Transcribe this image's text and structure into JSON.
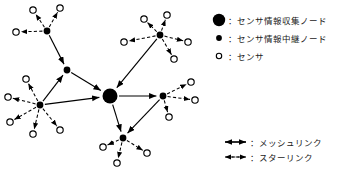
{
  "figure": {
    "title": "",
    "description_type": "wireless-sensor-network-topology"
  },
  "legend_nodes": {
    "items": [
      {
        "marker": "large-filled-circle",
        "separator": "：",
        "label": "センサ情報収集ノード"
      },
      {
        "marker": "small-filled-circle",
        "separator": "：",
        "label": "センサ情報中継ノード"
      },
      {
        "marker": "small-open-circle",
        "separator": "：",
        "label": "センサ"
      }
    ]
  },
  "legend_links": {
    "items": [
      {
        "marker": "solid-double-arrow",
        "separator": "：",
        "label": "メッシュリンク"
      },
      {
        "marker": "dashed-double-arrow",
        "separator": "：",
        "label": "スターリンク"
      }
    ]
  },
  "colors": {
    "ink": "#000000",
    "background": "#ffffff",
    "text": "#1a1a1a"
  },
  "chart_data": {
    "type": "diagram",
    "graph": {
      "collection_nodes": [
        {
          "id": "C1",
          "x": 110,
          "y": 96,
          "r": 7.5
        }
      ],
      "relay_nodes": [
        {
          "id": "R1",
          "x": 47,
          "y": 31,
          "r": 3.4
        },
        {
          "id": "R2",
          "x": 160,
          "y": 35,
          "r": 3.4
        },
        {
          "id": "R3",
          "x": 67,
          "y": 70,
          "r": 3.4
        },
        {
          "id": "R4",
          "x": 40,
          "y": 105,
          "r": 3.4
        },
        {
          "id": "R5",
          "x": 163,
          "y": 96,
          "r": 3.4
        },
        {
          "id": "R6",
          "x": 123,
          "y": 138,
          "r": 3.4
        }
      ],
      "sensors": [
        {
          "id": "S1",
          "x": 33,
          "y": 10,
          "parent": "R1"
        },
        {
          "id": "S2",
          "x": 60,
          "y": 8,
          "parent": "R1"
        },
        {
          "id": "S3",
          "x": 16,
          "y": 32,
          "parent": "R1"
        },
        {
          "id": "S4",
          "x": 144,
          "y": 19,
          "parent": "R2"
        },
        {
          "id": "S5",
          "x": 167,
          "y": 15,
          "parent": "R2"
        },
        {
          "id": "S6",
          "x": 124,
          "y": 42,
          "parent": "R2"
        },
        {
          "id": "S7",
          "x": 188,
          "y": 42,
          "parent": "R2"
        },
        {
          "id": "S8",
          "x": 174,
          "y": 59,
          "parent": "R2"
        },
        {
          "id": "S9",
          "x": 26,
          "y": 79,
          "parent": "R4"
        },
        {
          "id": "S10",
          "x": 8,
          "y": 97,
          "parent": "R4"
        },
        {
          "id": "S11",
          "x": 10,
          "y": 122,
          "parent": "R4"
        },
        {
          "id": "S12",
          "x": 33,
          "y": 134,
          "parent": "R4"
        },
        {
          "id": "S13",
          "x": 60,
          "y": 130,
          "parent": "R4"
        },
        {
          "id": "S14",
          "x": 191,
          "y": 82,
          "parent": "R5"
        },
        {
          "id": "S15",
          "x": 195,
          "y": 100,
          "parent": "R5"
        },
        {
          "id": "S16",
          "x": 169,
          "y": 117,
          "parent": "R5"
        },
        {
          "id": "S17",
          "x": 103,
          "y": 147,
          "parent": "R6"
        },
        {
          "id": "S18",
          "x": 117,
          "y": 163,
          "parent": "R6"
        },
        {
          "id": "S19",
          "x": 147,
          "y": 153,
          "parent": "R6"
        }
      ],
      "mesh_links": [
        {
          "from": "R1",
          "to": "R3"
        },
        {
          "from": "R3",
          "to": "C1"
        },
        {
          "from": "R4",
          "to": "R3"
        },
        {
          "from": "R4",
          "to": "C1"
        },
        {
          "from": "R2",
          "to": "C1"
        },
        {
          "from": "C1",
          "to": "R5"
        },
        {
          "from": "C1",
          "to": "R6"
        },
        {
          "from": "R5",
          "to": "R6"
        }
      ],
      "counts": {
        "collection_nodes": 1,
        "relay_nodes": 6,
        "sensors": 19
      }
    }
  }
}
